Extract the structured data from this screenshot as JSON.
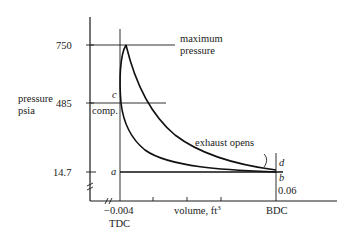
{
  "diagram": {
    "type": "pressure-volume indicator diagram",
    "y_axis": {
      "label_line1": "pressure",
      "label_line2": "psia",
      "ticks": [
        "750",
        "485",
        "14.7"
      ]
    },
    "x_axis": {
      "label": "volume, ft",
      "label_superscript": "3",
      "ticks": [
        "−0.004",
        "0.06"
      ],
      "tdc_label": "TDC",
      "bdc_label": "BDC"
    },
    "annotations": {
      "max_pressure_line1": "maximum",
      "max_pressure_line2": "pressure",
      "exhaust": "exhaust opens",
      "compression": "comp.",
      "point_a": "a",
      "point_b": "b",
      "point_c": "c",
      "point_d": "d"
    },
    "colors": {
      "ink": "#1a1a1a",
      "background": "#ffffff"
    }
  }
}
